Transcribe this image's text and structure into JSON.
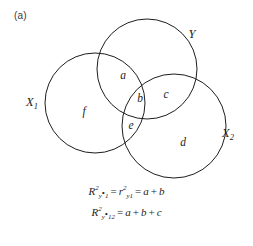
{
  "figure": {
    "panel_label": "(a)",
    "type": "venn-diagram",
    "background_color": "#ffffff",
    "stroke_color": "#1d1d1d",
    "text_color": "#1d1d1d"
  },
  "sets": [
    {
      "id": "x1",
      "label_base": "X",
      "label_sub": "1",
      "label_x": 32,
      "label_y": 106,
      "cx": 95,
      "cy": 103,
      "r": 50
    },
    {
      "id": "y",
      "label_base": "Y",
      "label_sub": "",
      "label_x": 192,
      "label_y": 38,
      "cx": 147,
      "cy": 69,
      "r": 50
    },
    {
      "id": "x2",
      "label_base": "X",
      "label_sub": "2",
      "label_x": 228,
      "label_y": 137,
      "cx": 174,
      "cy": 126,
      "r": 52
    }
  ],
  "regions": [
    {
      "id": "a",
      "label": "a",
      "x": 123,
      "y": 79,
      "meaning": "Y only with X1"
    },
    {
      "id": "b",
      "label": "b",
      "x": 140,
      "y": 102,
      "meaning": "X1 and Y and X2"
    },
    {
      "id": "c",
      "label": "c",
      "x": 166,
      "y": 98,
      "meaning": "Y and X2 only"
    },
    {
      "id": "d",
      "label": "d",
      "x": 183,
      "y": 146,
      "meaning": "X2 only"
    },
    {
      "id": "e",
      "label": "e",
      "x": 131,
      "y": 129,
      "meaning": "X1 and X2 only"
    },
    {
      "id": "f",
      "label": "f",
      "x": 84,
      "y": 115,
      "meaning": "X1 only"
    }
  ],
  "equations": [
    {
      "id": "eq1",
      "lhs_base": "R",
      "lhs_sup": "2",
      "lhs_sub": "y",
      "lhs_sub2": "1",
      "mid_base": "r",
      "mid_sup": "2",
      "mid_sub": "y1",
      "rhs": "a + b",
      "text": "R²y·1 = r²y1 = a + b"
    },
    {
      "id": "eq2",
      "lhs_base": "R",
      "lhs_sup": "2",
      "lhs_sub": "y",
      "lhs_sub2": "12",
      "rhs": "a + b + c",
      "text": "R²y·12 = a + b + c"
    }
  ]
}
